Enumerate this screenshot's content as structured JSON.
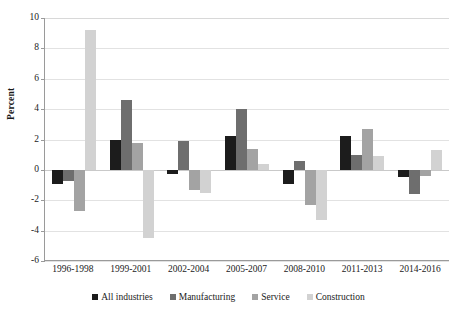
{
  "chart_data": {
    "type": "bar",
    "title": "",
    "subtitle": "",
    "xlabel": "",
    "ylabel": "Percent",
    "ylim": [
      -6,
      10
    ],
    "ytick_values": [
      10,
      8,
      6,
      4,
      2,
      0,
      -2,
      -4,
      -6
    ],
    "ytick_labels": [
      "10",
      "8",
      "6",
      "4",
      "2",
      "0",
      "-2",
      "-4",
      "-6"
    ],
    "grid": true,
    "grid_axis": "y",
    "legend_position": "bottom",
    "categories": [
      "1996-1998",
      "1999-2001",
      "2002-2004",
      "2005-2007",
      "2008-2010",
      "2011-2013",
      "2014-2016"
    ],
    "series": [
      {
        "name": "All industries",
        "color": "#1c1c1c",
        "values": [
          -0.9,
          2.0,
          -0.3,
          2.2,
          -0.9,
          2.2,
          -0.5
        ]
      },
      {
        "name": "Manufacturing",
        "color": "#6e6e6e",
        "values": [
          -0.7,
          4.6,
          1.9,
          4.0,
          0.6,
          1.0,
          -1.6
        ]
      },
      {
        "name": "Service",
        "color": "#a3a3a3",
        "values": [
          -2.7,
          1.8,
          -1.3,
          1.4,
          -2.3,
          2.7,
          -0.4
        ]
      },
      {
        "name": "Construction",
        "color": "#d2d2d2",
        "values": [
          9.2,
          -4.5,
          -1.5,
          0.4,
          -3.3,
          0.9,
          1.3
        ]
      }
    ]
  },
  "axis": {
    "y_title": "Percent"
  }
}
